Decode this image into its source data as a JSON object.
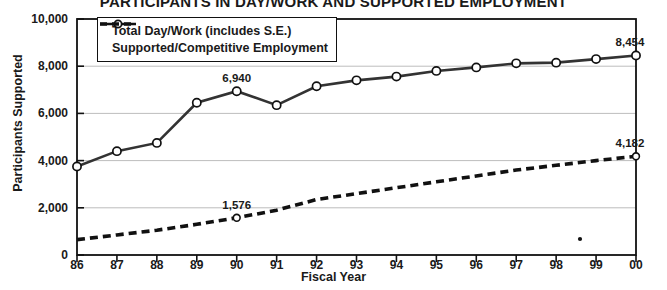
{
  "chart_data": {
    "type": "line",
    "title": "PARTICIPANTS IN DAY/WORK AND SUPPORTED EMPLOYMENT",
    "xlabel": "Fiscal Year",
    "ylabel": "Participants Supported",
    "categories": [
      "86",
      "87",
      "88",
      "89",
      "90",
      "91",
      "92",
      "93",
      "94",
      "95",
      "96",
      "97",
      "98",
      "99",
      "00"
    ],
    "ylim": [
      0,
      10000
    ],
    "yticks": [
      0,
      2000,
      4000,
      6000,
      8000,
      10000
    ],
    "ytick_labels": [
      "0",
      "2,000",
      "4,000",
      "6,000",
      "8,000",
      "10,000"
    ],
    "grid": true,
    "legend_position": "top-left",
    "series": [
      {
        "name": "Total Day/Work (includes S.E.)",
        "style": "solid-with-open-circle-markers",
        "values": [
          3750,
          4400,
          4750,
          6450,
          6940,
          6350,
          7150,
          7400,
          7560,
          7800,
          7950,
          8120,
          8150,
          8300,
          8454
        ]
      },
      {
        "name": "Supported/Competitive Employment",
        "style": "dashed",
        "values": [
          650,
          850,
          1050,
          1300,
          1576,
          1900,
          2350,
          2600,
          2850,
          3100,
          3350,
          3600,
          3800,
          4000,
          4182
        ]
      }
    ],
    "annotations": [
      {
        "label": "6,940",
        "series": 0,
        "category": "90"
      },
      {
        "label": "8,454",
        "series": 0,
        "category": "00"
      },
      {
        "label": "1,576",
        "series": 1,
        "category": "90"
      },
      {
        "label": "4,182",
        "series": 1,
        "category": "00"
      },
      {
        "label": "*",
        "series": null,
        "category": "98-99",
        "note": "footnote-marker-near-axis"
      }
    ]
  }
}
